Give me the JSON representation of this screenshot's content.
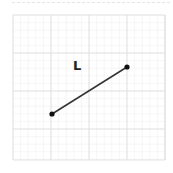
{
  "diagram": {
    "label": "L",
    "grid": {
      "x0": 13,
      "y0": 15,
      "x1": 165,
      "y1": 160,
      "major_step": 38,
      "minor_step": 7.6,
      "major_color": "#e0e0e0",
      "minor_color": "#f0f0f0"
    },
    "segment": {
      "start": {
        "x": 52,
        "y": 114
      },
      "end": {
        "x": 127,
        "y": 67
      },
      "color": "#333333",
      "point_color": "#111111"
    }
  }
}
